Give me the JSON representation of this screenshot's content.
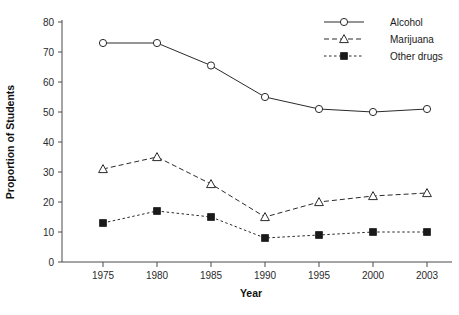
{
  "chart_data": {
    "type": "line",
    "title": "",
    "xlabel": "Year",
    "ylabel": "Proportion of Students",
    "x": [
      1975,
      1980,
      1985,
      1990,
      1995,
      2000,
      2003
    ],
    "xtick_labels": [
      "1975",
      "1980",
      "1985",
      "1990",
      "1995",
      "2000",
      "2003"
    ],
    "ytick_labels": [
      "0",
      "10",
      "20",
      "30",
      "40",
      "50",
      "60",
      "70",
      "80"
    ],
    "yticks": [
      0,
      10,
      20,
      30,
      40,
      50,
      60,
      70,
      80
    ],
    "ylim": [
      0,
      80
    ],
    "grid": false,
    "legend_position": "top-right",
    "series": [
      {
        "name": "Alcohol",
        "values": [
          73,
          73,
          65.5,
          55,
          51,
          50,
          51
        ],
        "marker": "open-circle",
        "linestyle": "solid",
        "color": "#2a2a2a"
      },
      {
        "name": "Marijuana",
        "values": [
          31,
          35,
          26,
          15,
          20,
          22,
          23
        ],
        "marker": "open-triangle",
        "linestyle": "dashed",
        "color": "#2a2a2a"
      },
      {
        "name": "Other drugs",
        "values": [
          13,
          17,
          15,
          8,
          9,
          10,
          10
        ],
        "marker": "filled-square",
        "linestyle": "dotted",
        "color": "#2a2a2a"
      }
    ]
  },
  "legend": {
    "items": [
      {
        "label": "Alcohol"
      },
      {
        "label": "Marijuana"
      },
      {
        "label": "Other drugs"
      }
    ]
  }
}
